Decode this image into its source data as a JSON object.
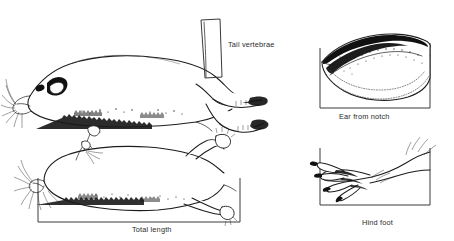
{
  "plate": {
    "title": "Standard external measurements of a small mammal",
    "background_color": "#ffffff",
    "ink_color": "#1d1d1d",
    "box_color": "#3a3a3a",
    "caption_color": "#2b2b2b"
  },
  "figures": [
    {
      "id": "tail-vertebrae",
      "label": "Tail vertebrae",
      "view": "lateral",
      "bracket": "narrow vertical quadrilateral at base of tail",
      "caption_position": "right-of-bracket"
    },
    {
      "id": "ear-from-notch",
      "label": "Ear from notch",
      "view": "ear pinna, lateral",
      "bracket": "open-top rectangle under ear",
      "caption_position": "below"
    },
    {
      "id": "total-length",
      "label": "Total length",
      "view": "dorsal, specimen laid out",
      "bracket": "open-top rectangle spanning nose to tail base",
      "caption_position": "below"
    },
    {
      "id": "hind-foot",
      "label": "Hind foot",
      "view": "lateral hind foot with claws",
      "bracket": "open-top rectangle under foot",
      "caption_position": "below"
    }
  ],
  "captions": {
    "tail_vertebrae": "Tail vertebrae",
    "ear_from_notch": "Ear from notch",
    "total_length": "Total length",
    "hind_foot": "Hind foot"
  }
}
